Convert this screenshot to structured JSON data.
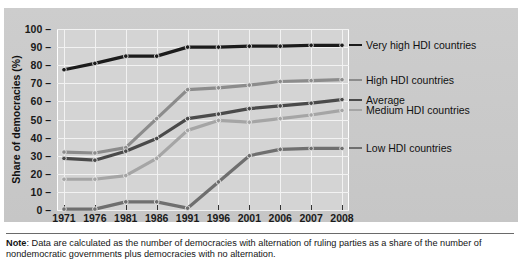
{
  "chart_data": {
    "type": "line",
    "title": "",
    "subtitle": "",
    "xlabel": "",
    "ylabel": "Share of democracies (%)",
    "x": [
      1971,
      1976,
      1981,
      1986,
      1991,
      1996,
      2001,
      2006,
      2007,
      2008
    ],
    "xticklabels": [
      "1971",
      "1976",
      "1981",
      "1986",
      "1991",
      "1996",
      "2001",
      "2006",
      "2007",
      "2008"
    ],
    "yticklabels": [
      "0",
      "10",
      "20",
      "30",
      "40",
      "50",
      "60",
      "70",
      "80",
      "90",
      "100"
    ],
    "yticks": [
      0,
      10,
      20,
      30,
      40,
      50,
      60,
      70,
      80,
      90,
      100
    ],
    "ylim": [
      0,
      100
    ],
    "grid": true,
    "legend_position": "right-inline",
    "series": [
      {
        "name": "Very high HDI countries",
        "color": "#1b1b1b",
        "values": [
          77.5,
          81,
          85,
          85,
          90,
          90,
          90.5,
          90.5,
          91,
          91
        ]
      },
      {
        "name": "High HDI countries",
        "color": "#8c8c8c",
        "values": [
          32,
          31.5,
          34.5,
          50.5,
          66.5,
          67.5,
          69,
          71,
          71.5,
          72
        ]
      },
      {
        "name": "Average",
        "color": "#4a4a4a",
        "values": [
          28.5,
          27.5,
          32.5,
          39.5,
          50.5,
          53,
          56,
          57.5,
          59,
          61
        ]
      },
      {
        "name": "Medium HDI countries",
        "color": "#a5a5a5",
        "values": [
          17,
          17,
          19,
          28.5,
          44,
          49.5,
          48.5,
          50.5,
          52.5,
          55
        ]
      },
      {
        "name": "Low HDI countries",
        "color": "#6f6f6f",
        "values": [
          0.5,
          0.5,
          4.5,
          4.5,
          1,
          15.5,
          30,
          33.5,
          34,
          34
        ]
      }
    ],
    "annotations": []
  },
  "note": {
    "prefix": "Note",
    "separator": ": ",
    "text": "Data are calculated as the number of democracies with alternation of ruling parties as a share of the number of nondemocratic governments plus democracies with no alternation."
  }
}
